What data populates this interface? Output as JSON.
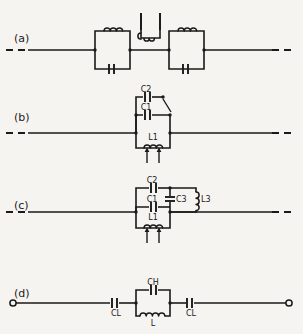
{
  "figure": {
    "background_color": "#f6f4f0",
    "line_color": "#1a1a1a",
    "width": 303,
    "height": 334
  },
  "rows": [
    {
      "id": "a",
      "label": "(a)",
      "description": "two series parallel-LC tanks with a shunt parallel-LC tank between them",
      "line_ends": "dashed",
      "components": []
    },
    {
      "id": "b",
      "label": "(b)",
      "description": "shunt network: C2 with series switch, C1, and tunable L1 in parallel",
      "line_ends": "dashed",
      "components": [
        {
          "name": "C2",
          "type": "capacitor"
        },
        {
          "name": "C1",
          "type": "capacitor"
        },
        {
          "name": "L1",
          "type": "inductor-tunable"
        }
      ]
    },
    {
      "id": "c",
      "label": "(c)",
      "description": "shunt network: C2 in series with parallel C3/L3, plus C1 and tunable L1",
      "line_ends": "dashed",
      "components": [
        {
          "name": "C2",
          "type": "capacitor"
        },
        {
          "name": "C3",
          "type": "capacitor"
        },
        {
          "name": "L3",
          "type": "inductor"
        },
        {
          "name": "C1",
          "type": "capacitor"
        },
        {
          "name": "L1",
          "type": "inductor-tunable"
        }
      ]
    },
    {
      "id": "d",
      "label": "(d)",
      "description": "series CL, parallel CH/L tank, series CL, open terminals at both ends",
      "line_ends": "terminals",
      "components": [
        {
          "name": "CL",
          "type": "capacitor"
        },
        {
          "name": "CH",
          "type": "capacitor"
        },
        {
          "name": "L",
          "type": "inductor"
        },
        {
          "name": "CL",
          "type": "capacitor"
        }
      ]
    }
  ],
  "labels": {
    "row_a": "(a)",
    "row_b": "(b)",
    "row_c": "(c)",
    "row_d": "(d)",
    "b_c2": "C2",
    "b_c1": "C1",
    "b_l1": "L1",
    "c_c2": "C2",
    "c_c1": "C1",
    "c_c3": "C3",
    "c_l3": "L3",
    "c_l1": "L1",
    "d_cl_left": "CL",
    "d_ch": "CH",
    "d_l": "L",
    "d_cl_right": "CL"
  }
}
